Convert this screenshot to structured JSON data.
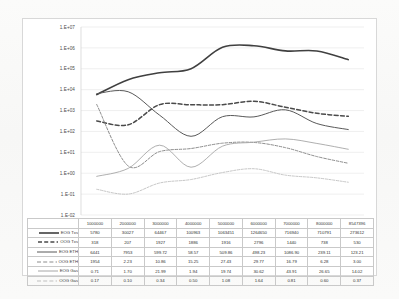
{
  "chart_data": {
    "type": "line",
    "title": "",
    "xlabel": "",
    "ylabel": "",
    "yscale": "log",
    "ylim": [
      0.01,
      10000000
    ],
    "grid": true,
    "legend_position": "table-below",
    "ytick_labels": [
      "1.E+07",
      "1.E+06",
      "1.E+05",
      "1.E+04",
      "1.E+03",
      "1.E+02",
      "1.E+01",
      "1.E+00",
      "1.E-01",
      "1.E-02"
    ],
    "ytick_values": [
      10000000,
      1000000,
      100000,
      10000,
      1000,
      100,
      10,
      1,
      0.1,
      0.01
    ],
    "categories": [
      "1000000",
      "2000000",
      "3000000",
      "4000000",
      "5000000",
      "6000000",
      "7000000",
      "8000000",
      "8547396"
    ],
    "series": [
      {
        "name": "EOG Txs",
        "style": "solid",
        "color": "#404040",
        "width": 1.6,
        "values": [
          5780,
          30027,
          64467,
          100963,
          1063451,
          1264650,
          716940,
          710791,
          273612
        ]
      },
      {
        "name": "OOG Txs",
        "style": "dashed",
        "color": "#4a4a4a",
        "width": 1.5,
        "values": [
          318,
          207,
          1927,
          1886,
          1916,
          2796,
          1440,
          738,
          530
        ]
      },
      {
        "name": "EOG ETH",
        "style": "solid",
        "color": "#595959",
        "width": 1.0,
        "values": [
          6441,
          7953,
          599.72,
          58.57,
          509.86,
          498.23,
          1086.9,
          239.11,
          123.21
        ]
      },
      {
        "name": "OOG ETH",
        "style": "dashed",
        "color": "#8c8c8c",
        "width": 1.0,
        "values": [
          1954,
          2.23,
          10.86,
          15.25,
          27.43,
          29.77,
          16.79,
          6.28,
          3.0
        ]
      },
      {
        "name": "EOG Gas",
        "style": "solid",
        "color": "#a6a6a6",
        "width": 0.9,
        "values": [
          0.71,
          1.7,
          21.99,
          1.94,
          19.74,
          30.62,
          43.91,
          26.65,
          14.02
        ]
      },
      {
        "name": "OOG Gas",
        "style": "dashed",
        "color": "#bfbfbf",
        "width": 0.9,
        "values": [
          0.17,
          0.1,
          0.34,
          0.5,
          1.08,
          1.64,
          0.81,
          0.6,
          0.37
        ]
      }
    ]
  },
  "table": {
    "corner": "",
    "headers": [
      "1000000",
      "2000000",
      "3000000",
      "4000000",
      "5000000",
      "6000000",
      "7000000",
      "8000000",
      "8547396"
    ],
    "rows": [
      {
        "label": "EOG Txs",
        "cells": [
          "5780",
          "30027",
          "64467",
          "100963",
          "1063451",
          "1264650",
          "716940",
          "710791",
          "273612"
        ]
      },
      {
        "label": "OOG Txs",
        "cells": [
          "318",
          "207",
          "1927",
          "1886",
          "1916",
          "2796",
          "1440",
          "738",
          "530"
        ]
      },
      {
        "label": "EOG ETH",
        "cells": [
          "6441",
          "7953",
          "599.72",
          "58.57",
          "509.86",
          "498.23",
          "1086.90",
          "239.11",
          "123.21"
        ]
      },
      {
        "label": "OOG ETH",
        "cells": [
          "1954",
          "2.23",
          "10.86",
          "15.25",
          "27.43",
          "29.77",
          "16.79",
          "6.28",
          "3.00"
        ]
      },
      {
        "label": "EOG Gas",
        "cells": [
          "0.71",
          "1.70",
          "21.99",
          "1.94",
          "19.74",
          "30.62",
          "43.91",
          "26.65",
          "14.02"
        ]
      },
      {
        "label": "OOG Gas",
        "cells": [
          "0.17",
          "0.10",
          "0.34",
          "0.50",
          "1.08",
          "1.64",
          "0.81",
          "0.60",
          "0.37"
        ]
      }
    ]
  }
}
